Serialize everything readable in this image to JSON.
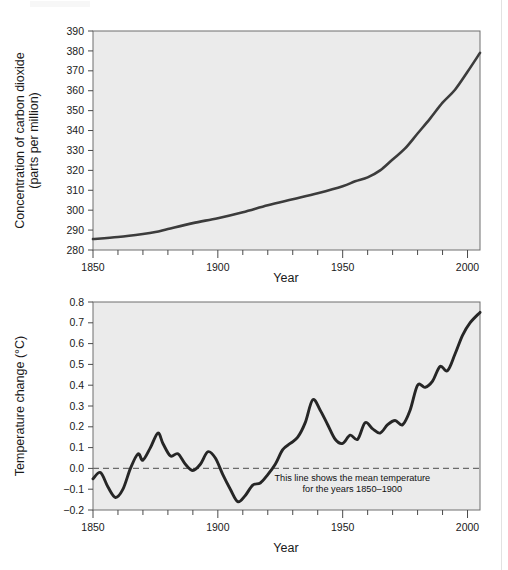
{
  "page": {
    "background_color": "#ffffff",
    "plot_background_color": "#ebebeb",
    "line_color": "#3c3c3c"
  },
  "artifacts": {
    "ghost_text_1": "Whole",
    "ghost_text_2": "noil ligingo o'nsu",
    "ghost_text_3": "ngnu e ni"
  },
  "chart_data": [
    {
      "id": "co2",
      "type": "line",
      "title": "",
      "xlabel": "Year",
      "ylabel": "Concentration of carbon dioxide (parts per million)",
      "ylabel_lines": [
        "Concentration of carbon dioxide",
        "(parts per million)"
      ],
      "xlim": [
        1850,
        2005
      ],
      "ylim": [
        280,
        390
      ],
      "xticks": [
        1850,
        1900,
        1950,
        2000
      ],
      "xticklabels": [
        "1850",
        "1900",
        "1950",
        "2000"
      ],
      "xtick_minor_step": 10,
      "yticks": [
        280,
        290,
        300,
        310,
        320,
        330,
        340,
        350,
        360,
        370,
        380,
        390
      ],
      "yticklabels": [
        "280",
        "290",
        "300",
        "310",
        "320",
        "330",
        "340",
        "350",
        "360",
        "370",
        "380",
        "390"
      ],
      "grid": false,
      "legend": "none",
      "series": [
        {
          "name": "Atmospheric CO2 concentration",
          "x": [
            1850,
            1860,
            1870,
            1875,
            1880,
            1890,
            1900,
            1910,
            1920,
            1930,
            1940,
            1950,
            1955,
            1960,
            1965,
            1970,
            1975,
            1980,
            1985,
            1990,
            1995,
            2000,
            2005
          ],
          "values": [
            285.5,
            286.5,
            288.0,
            289.0,
            290.5,
            293.5,
            296.0,
            299.0,
            302.5,
            305.5,
            308.5,
            312.0,
            314.5,
            316.5,
            320.0,
            325.5,
            331.0,
            338.5,
            346.0,
            354.0,
            360.5,
            369.5,
            379.0
          ]
        }
      ]
    },
    {
      "id": "temperature",
      "type": "line",
      "title": "",
      "xlabel": "Year",
      "ylabel": "Temperature change (°C)",
      "xlim": [
        1850,
        2005
      ],
      "ylim": [
        -0.2,
        0.8
      ],
      "xticks": [
        1850,
        1900,
        1950,
        2000
      ],
      "xticklabels": [
        "1850",
        "1900",
        "1950",
        "2000"
      ],
      "xtick_minor_step": 10,
      "yticks": [
        -0.2,
        -0.1,
        0.0,
        0.1,
        0.2,
        0.3,
        0.4,
        0.5,
        0.6,
        0.7,
        0.8
      ],
      "yticklabels": [
        "−0.2",
        "−0.1",
        "0.0",
        "0.1",
        "0.2",
        "0.3",
        "0.4",
        "0.5",
        "0.6",
        "0.7",
        "0.8"
      ],
      "grid": false,
      "legend": "none",
      "reference_line": {
        "value": 0.0,
        "style": "dashed",
        "annotation_lines": [
          "This line shows the mean temperature",
          "for the years 1850–1900"
        ]
      },
      "series": [
        {
          "name": "Global mean temperature change",
          "x": [
            1850,
            1853,
            1856,
            1859,
            1862,
            1865,
            1868,
            1870,
            1873,
            1876,
            1878,
            1881,
            1884,
            1887,
            1890,
            1893,
            1896,
            1899,
            1902,
            1905,
            1908,
            1911,
            1914,
            1917,
            1920,
            1923,
            1926,
            1929,
            1932,
            1935,
            1938,
            1941,
            1944,
            1947,
            1950,
            1953,
            1956,
            1959,
            1962,
            1965,
            1968,
            1971,
            1974,
            1977,
            1980,
            1983,
            1986,
            1989,
            1992,
            1995,
            1998,
            2001,
            2005
          ],
          "values": [
            -0.05,
            -0.02,
            -0.09,
            -0.14,
            -0.1,
            0.0,
            0.07,
            0.04,
            0.1,
            0.17,
            0.12,
            0.06,
            0.07,
            0.02,
            -0.01,
            0.02,
            0.08,
            0.05,
            -0.03,
            -0.1,
            -0.16,
            -0.13,
            -0.08,
            -0.07,
            -0.03,
            0.02,
            0.09,
            0.12,
            0.15,
            0.22,
            0.33,
            0.28,
            0.21,
            0.14,
            0.12,
            0.16,
            0.14,
            0.22,
            0.19,
            0.17,
            0.21,
            0.23,
            0.21,
            0.28,
            0.4,
            0.39,
            0.42,
            0.49,
            0.47,
            0.55,
            0.64,
            0.7,
            0.75
          ]
        }
      ]
    }
  ]
}
